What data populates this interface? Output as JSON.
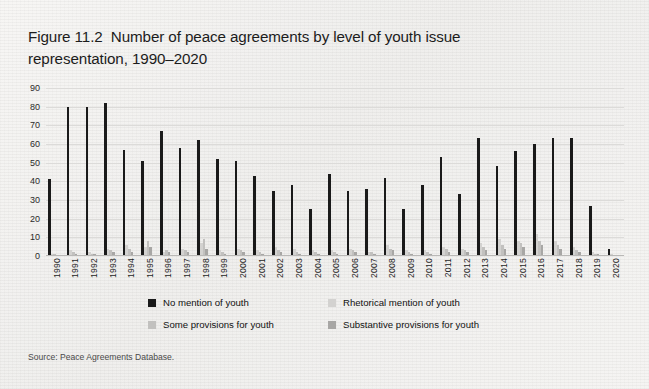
{
  "title": {
    "line1": "Figure 11.2  Number of peace agreements by level of youth issue",
    "line2": "representation, 1990–2020"
  },
  "source": "Source: Peace Agreements Database.",
  "legend": {
    "items": [
      {
        "label": "No mention of youth",
        "color": "#1a1a1a",
        "swatch_name": "legend-swatch-no-mention"
      },
      {
        "label": "Rhetorical mention of youth",
        "color": "#d3d2d0",
        "swatch_name": "legend-swatch-rhetorical"
      },
      {
        "label": "Some provisions for youth",
        "color": "#c2c1bf",
        "swatch_name": "legend-swatch-some-provisions"
      },
      {
        "label": "Substantive provisions for youth",
        "color": "#a8a7a5",
        "swatch_name": "legend-swatch-substantive"
      }
    ]
  },
  "chart_data": {
    "type": "bar",
    "title": "Figure 11.2  Number of peace agreements by level of youth issue representation, 1990–2020",
    "xlabel": "",
    "ylabel": "",
    "ylim": [
      0,
      90
    ],
    "yticks": [
      0,
      10,
      20,
      30,
      40,
      50,
      60,
      70,
      80,
      90
    ],
    "grid": true,
    "legend_position": "bottom",
    "grouped": true,
    "categories": [
      "1990",
      "1991",
      "1992",
      "1993",
      "1994",
      "1995",
      "1996",
      "1997",
      "1998",
      "1999",
      "2000",
      "2001",
      "2002",
      "2003",
      "2004",
      "2005",
      "2006",
      "2007",
      "2008",
      "2009",
      "2010",
      "2011",
      "2012",
      "2013",
      "2014",
      "2015",
      "2016",
      "2017",
      "2018",
      "2019",
      "2020"
    ],
    "series": [
      {
        "name": "No mention of youth",
        "color": "#1a1a1a",
        "values": [
          41,
          80,
          80,
          82,
          57,
          51,
          67,
          58,
          62,
          52,
          51,
          43,
          35,
          38,
          25,
          44,
          35,
          36,
          42,
          25,
          38,
          53,
          33,
          63,
          48,
          56,
          60,
          63,
          63,
          27,
          4
        ]
      },
      {
        "name": "Rhetorical mention of youth",
        "color": "#d3d2d0",
        "values": [
          1,
          3,
          2,
          4,
          6,
          5,
          2,
          4,
          7,
          3,
          4,
          3,
          5,
          4,
          3,
          3,
          4,
          2,
          6,
          3,
          3,
          5,
          4,
          7,
          9,
          8,
          12,
          8,
          5,
          2,
          1
        ]
      },
      {
        "name": "Some provisions for youth",
        "color": "#c2c1bf",
        "values": [
          1,
          2,
          1,
          3,
          4,
          8,
          3,
          3,
          9,
          2,
          3,
          2,
          3,
          2,
          2,
          2,
          3,
          2,
          4,
          2,
          2,
          4,
          3,
          5,
          6,
          7,
          8,
          6,
          3,
          1,
          0
        ]
      },
      {
        "name": "Substantive provisions for youth",
        "color": "#a8a7a5",
        "values": [
          0,
          1,
          1,
          2,
          2,
          5,
          2,
          2,
          4,
          1,
          2,
          1,
          2,
          1,
          1,
          1,
          2,
          1,
          3,
          1,
          1,
          2,
          2,
          3,
          4,
          5,
          6,
          4,
          2,
          1,
          0
        ]
      }
    ]
  }
}
